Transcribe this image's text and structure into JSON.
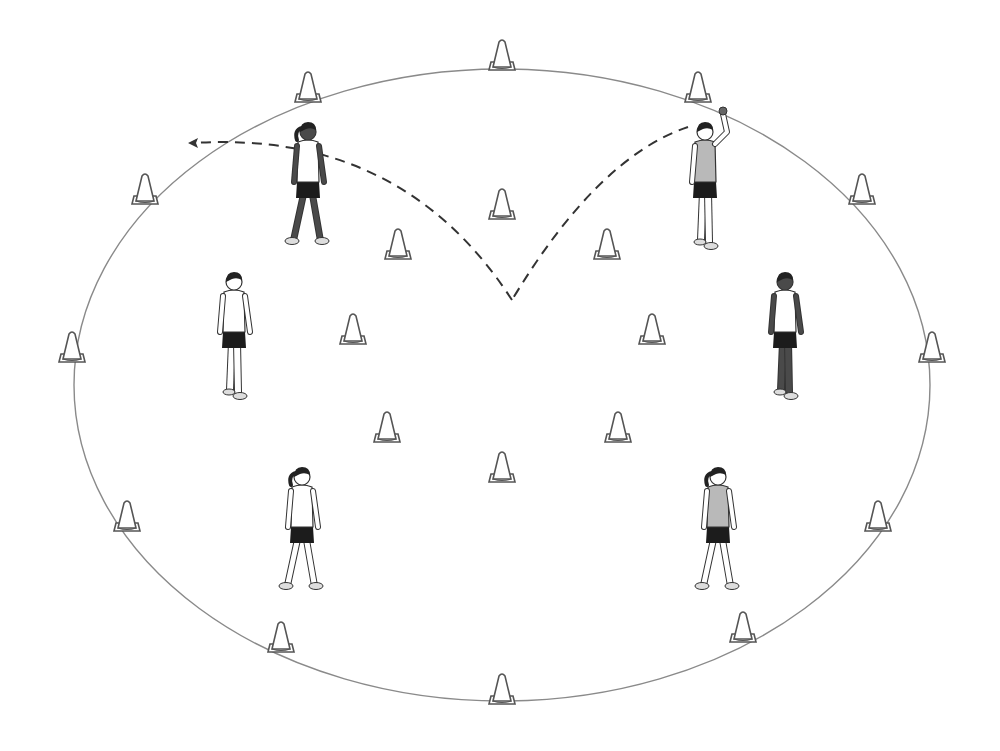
{
  "diagram": {
    "type": "drill-layout",
    "colors": {
      "background": "#ffffff",
      "field_line": "#8a8a8a",
      "cone_stroke": "#555555",
      "path_line": "#333333",
      "skin_dark": "#4a4a4a",
      "shirt_gray": "#b9b9b9",
      "shorts": "#1c1c1c",
      "hair": "#222222"
    },
    "field": {
      "shape": "ellipse",
      "cx": 502,
      "cy": 385,
      "rx": 428,
      "ry": 316
    },
    "outer_cones": [
      {
        "x": 502,
        "y": 66
      },
      {
        "x": 698,
        "y": 98
      },
      {
        "x": 862,
        "y": 200
      },
      {
        "x": 932,
        "y": 358
      },
      {
        "x": 878,
        "y": 527
      },
      {
        "x": 743,
        "y": 638
      },
      {
        "x": 502,
        "y": 700
      },
      {
        "x": 281,
        "y": 648
      },
      {
        "x": 127,
        "y": 527
      },
      {
        "x": 72,
        "y": 358
      },
      {
        "x": 145,
        "y": 200
      },
      {
        "x": 308,
        "y": 98
      }
    ],
    "inner_cones": [
      {
        "x": 502,
        "y": 215
      },
      {
        "x": 607,
        "y": 255
      },
      {
        "x": 652,
        "y": 340
      },
      {
        "x": 618,
        "y": 438
      },
      {
        "x": 502,
        "y": 478
      },
      {
        "x": 387,
        "y": 438
      },
      {
        "x": 353,
        "y": 340
      },
      {
        "x": 398,
        "y": 255
      }
    ],
    "players": [
      {
        "id": "top-left",
        "x": 308,
        "y": 190,
        "pose": "walking",
        "facing": "right",
        "skin": "dark",
        "shirt": "white",
        "hair": "ponytail"
      },
      {
        "id": "top-right",
        "x": 705,
        "y": 190,
        "pose": "throwing",
        "facing": "left",
        "skin": "light",
        "shirt": "gray",
        "hair": "short"
      },
      {
        "id": "mid-left",
        "x": 234,
        "y": 340,
        "pose": "standing",
        "facing": "right",
        "skin": "light",
        "shirt": "white",
        "hair": "short"
      },
      {
        "id": "mid-right",
        "x": 785,
        "y": 340,
        "pose": "standing",
        "facing": "left",
        "skin": "dark",
        "shirt": "white",
        "hair": "short"
      },
      {
        "id": "bottom-left",
        "x": 302,
        "y": 535,
        "pose": "walking",
        "facing": "away",
        "skin": "light",
        "shirt": "white",
        "hair": "ponytail"
      },
      {
        "id": "bottom-right",
        "x": 718,
        "y": 535,
        "pose": "walking",
        "facing": "away",
        "skin": "light",
        "shirt": "gray",
        "hair": "ponytail"
      }
    ],
    "ball_path": {
      "style": "dashed",
      "segments": [
        {
          "from": {
            "x": 688,
            "y": 127
          },
          "to": {
            "x": 512,
            "y": 300
          },
          "label": "throw"
        },
        {
          "from": {
            "x": 512,
            "y": 300
          },
          "to": {
            "x": 188,
            "y": 143
          },
          "label": "bounce-rebound"
        }
      ],
      "arrowhead_at": {
        "x": 188,
        "y": 143
      }
    }
  }
}
